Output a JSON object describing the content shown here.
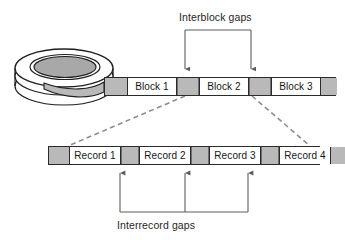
{
  "figure": {
    "type": "storage-layout-diagram"
  },
  "annotations": {
    "interblock_label": "Interblock gaps",
    "interrecord_label": "Interrecord gaps"
  },
  "block_strip": {
    "name": "tape-block-track",
    "cells": [
      {
        "kind": "gap",
        "label": "",
        "width": 22
      },
      {
        "kind": "data",
        "label": "Block 1",
        "width": 50
      },
      {
        "kind": "gap",
        "label": "",
        "width": 22
      },
      {
        "kind": "data",
        "label": "Block 2",
        "width": 50
      },
      {
        "kind": "gap",
        "label": "",
        "width": 22
      },
      {
        "kind": "data",
        "label": "Block 3",
        "width": 50
      },
      {
        "kind": "gap",
        "label": "",
        "width": 16
      }
    ]
  },
  "record_strip": {
    "name": "tape-record-track",
    "cells": [
      {
        "kind": "gap",
        "label": "",
        "width": 20
      },
      {
        "kind": "data",
        "label": "Record 1",
        "width": 52
      },
      {
        "kind": "gap",
        "label": "",
        "width": 18
      },
      {
        "kind": "data",
        "label": "Record 2",
        "width": 52
      },
      {
        "kind": "gap",
        "label": "",
        "width": 18
      },
      {
        "kind": "data",
        "label": "Record 3",
        "width": 52
      },
      {
        "kind": "gap",
        "label": "",
        "width": 18
      },
      {
        "kind": "data",
        "label": "Record 4",
        "width": 52
      },
      {
        "kind": "gap",
        "label": "",
        "width": 14
      }
    ]
  },
  "reel": {
    "name": "tape-reel-illustration",
    "description": "stacked tape reel drawn as nested ellipses"
  },
  "colors": {
    "gap_fill": "#b9b9b9",
    "cell_fill": "#ffffff",
    "stroke": "#2a2a2a",
    "leader_dash": "#8d8d8d",
    "reel_hub": "#a8a8a8",
    "text": "#1f1f1f"
  },
  "connectors": {
    "interblock_bracket": {
      "name": "interblock-bracket",
      "left_arrow_x": 185,
      "right_arrow_x": 251,
      "top_y": 30,
      "arrow_tip_y": 75
    },
    "interrecord_bracket": {
      "name": "interrecord-bracket",
      "arrow_xs": [
        120,
        185,
        248
      ],
      "bottom_y": 212,
      "arrow_tip_y": 167
    },
    "zoom_leaders": {
      "name": "magnification-leader-lines",
      "left": {
        "x1": 185,
        "y1": 96,
        "x2": 68,
        "y2": 146
      },
      "right": {
        "x1": 252,
        "y1": 96,
        "x2": 310,
        "y2": 146
      }
    }
  }
}
